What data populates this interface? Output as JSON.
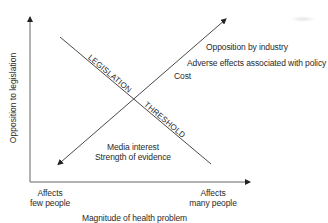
{
  "diagram": {
    "type": "conceptual-threshold-diagram",
    "y_axis": {
      "label": "Opposition to legislation"
    },
    "x_axis": {
      "label": "Magnitude of health problem",
      "left_tick": [
        "Affects",
        "few people"
      ],
      "right_tick": [
        "Affects",
        "many people"
      ]
    },
    "descending_line": {
      "upper_label": "LEGISLATION",
      "lower_label": "THRESHOLD"
    },
    "ascending_arrow": {
      "upper_factors": [
        "Opposition by industry",
        "Adverse effects associated with policy",
        "Cost"
      ],
      "lower_factors": [
        "Media interest",
        "Strength of evidence"
      ]
    },
    "colors": {
      "line": "#333333",
      "axis": "#555555",
      "text": "#2a2a2a",
      "background": "#ffffff"
    }
  }
}
